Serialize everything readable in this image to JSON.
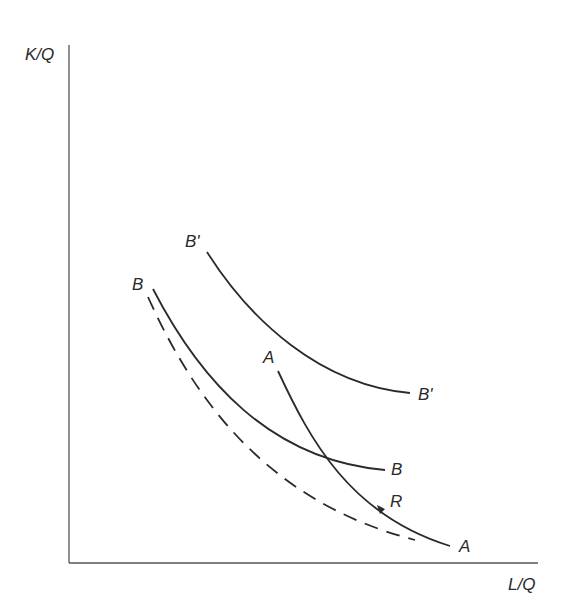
{
  "diagram": {
    "axes": {
      "y_label": "K/Q",
      "x_label": "L/Q"
    },
    "curves": [
      {
        "id": "B-prime",
        "style": "solid",
        "label_start": "B'",
        "label_end": "B'"
      },
      {
        "id": "B",
        "style": "solid",
        "label_start": "B",
        "label_end": "B"
      },
      {
        "id": "B-dashed",
        "style": "dashed"
      },
      {
        "id": "A",
        "style": "solid",
        "label_start": "A",
        "label_end": "A",
        "arrow_label": "R"
      }
    ],
    "colors": {
      "line": "#2a2a2a",
      "axis": "#555555",
      "background": "#ffffff"
    }
  }
}
